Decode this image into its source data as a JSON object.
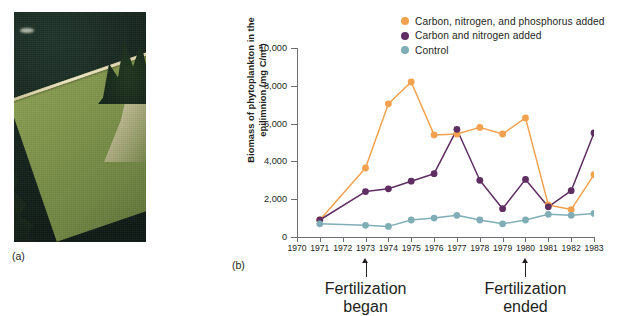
{
  "figure": {
    "panel_a_label": "(a)",
    "panel_b_label": "(b)"
  },
  "photo": {
    "alt_name": "aerial-photo-divided-lake",
    "colors": {
      "unfertilized_water": "#16241d",
      "fertilized_algal_water": "#7d924a",
      "curtain": "#efe6c4"
    }
  },
  "chart_data": {
    "type": "line",
    "title": "",
    "xlabel": "",
    "ylabel": "Biomass of phytoplankton in the epilimnion (mg C/m³)",
    "ylabel_line1": "Biomass of phytoplankton in the",
    "ylabel_line2": "epilimnion (mg C/m³)",
    "x": [
      1970,
      1971,
      1972,
      1973,
      1974,
      1975,
      1976,
      1977,
      1978,
      1979,
      1980,
      1981,
      1982,
      1983
    ],
    "xlim": [
      1970,
      1983
    ],
    "ylim": [
      0,
      10000
    ],
    "yticks": [
      0,
      2000,
      4000,
      6000,
      8000,
      10000
    ],
    "ytick_labels": [
      "0",
      "2,000",
      "4,000",
      "6,000",
      "8,000",
      "10,000"
    ],
    "xtick_labels": [
      "1970",
      "1971",
      "1972",
      "1973",
      "1974",
      "1975",
      "1976",
      "1977",
      "1978",
      "1979",
      "1980",
      "1981",
      "1982",
      "1983"
    ],
    "grid": false,
    "legend_position": "top-right",
    "series": [
      {
        "name": "Carbon, nitrogen, and phosphorus added",
        "color": "#F2A14E",
        "x": [
          1971,
          1973,
          1974,
          1975,
          1976,
          1977,
          1978,
          1979,
          1980,
          1981,
          1982,
          1983
        ],
        "values": [
          900,
          3650,
          7050,
          8200,
          5400,
          5450,
          5800,
          5450,
          6300,
          1700,
          1450,
          3300
        ]
      },
      {
        "name": "Carbon and nitrogen added",
        "color": "#5E2D62",
        "x": [
          1971,
          1973,
          1974,
          1975,
          1976,
          1977,
          1978,
          1979,
          1980,
          1981,
          1982,
          1983
        ],
        "values": [
          900,
          2400,
          2550,
          2950,
          3350,
          5700,
          3000,
          1500,
          3050,
          1600,
          2450,
          5500
        ]
      },
      {
        "name": "Control",
        "color": "#80AEB6",
        "x": [
          1971,
          1973,
          1974,
          1975,
          1976,
          1977,
          1978,
          1979,
          1980,
          1981,
          1982,
          1983
        ],
        "values": [
          700,
          620,
          560,
          900,
          1000,
          1150,
          900,
          700,
          900,
          1200,
          1150,
          1250
        ]
      }
    ],
    "annotations": [
      {
        "x": 1973,
        "line1": "Fertilization",
        "line2": "began"
      },
      {
        "x": 1980,
        "line1": "Fertilization",
        "line2": "ended"
      }
    ]
  }
}
